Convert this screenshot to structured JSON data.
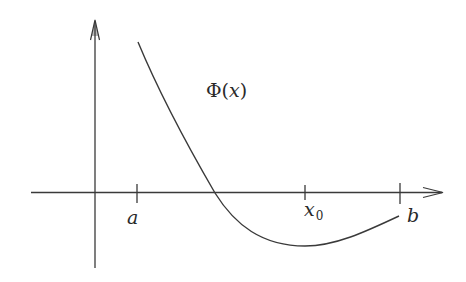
{
  "diagram": {
    "type": "function-graph",
    "function_label": {
      "symbol": "Φ",
      "open": "(",
      "variable": "x",
      "close": ")"
    },
    "x_axis": {
      "ticks": [
        {
          "name": "a",
          "label": "a",
          "subscript": ""
        },
        {
          "name": "x0",
          "label": "x",
          "subscript": "0"
        },
        {
          "name": "b",
          "label": "b",
          "subscript": ""
        }
      ]
    },
    "annotations": {
      "zero_crossing": "between a and x0",
      "minimum_near": "x0"
    },
    "colors": {
      "stroke": "#3a3a3a",
      "text": "#2a2a2a",
      "background": "#ffffff"
    }
  }
}
